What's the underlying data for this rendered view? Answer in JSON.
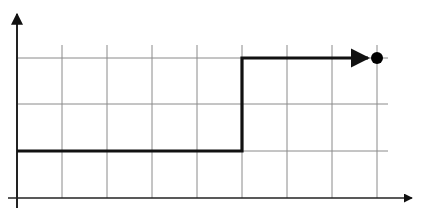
{
  "diagram": {
    "type": "step-function-graph",
    "colors": {
      "background": "#ffffff",
      "grid": "#8a8a8a",
      "axis": "#222222",
      "line": "#111111",
      "dot": "#000000"
    },
    "axes": {
      "x_axis": {
        "y": 198,
        "x_start": 8,
        "x_end": 412
      },
      "y_axis": {
        "x": 17,
        "y_start": 208,
        "y_end": 14
      }
    },
    "grid": {
      "vertical_x": [
        62,
        107,
        152,
        197,
        242,
        287,
        332,
        377
      ],
      "horizontal_y": [
        58,
        104,
        151
      ],
      "x_min": 17,
      "x_max": 388,
      "y_min": 45,
      "y_max": 198
    },
    "step_path": {
      "low_level_y": 151,
      "high_level_y": 58,
      "jump_x": 242,
      "start_x": 17,
      "end_x": 368
    },
    "endpoint": {
      "x": 377,
      "y": 58,
      "r": 6
    }
  }
}
